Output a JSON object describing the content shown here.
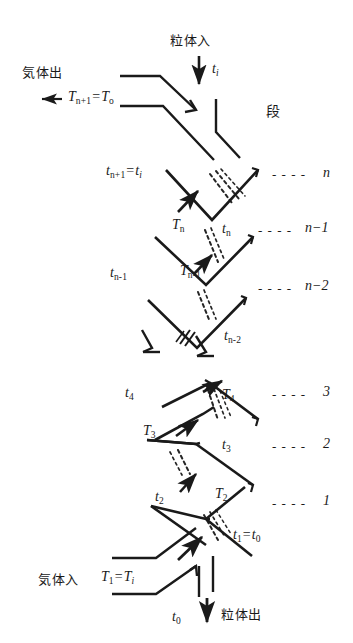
{
  "figure": {
    "domain_type": "process-flow-diagram",
    "ink_color": "#1a1a1a",
    "background_color": "#ffffff"
  },
  "header": {
    "stage_column_header": "段"
  },
  "inlets_outlets": {
    "particle_inlet_label": "粒体入",
    "particle_inlet_temp": "t",
    "particle_inlet_temp_sub": "i",
    "gas_outlet_label": "気体出",
    "gas_outlet_arrow": "←",
    "gas_inlet_label": "気体入",
    "particle_outlet_label": "粒体出",
    "particle_outlet_temp": "t",
    "particle_outlet_temp_sub": "0",
    "down_arrow": "↓"
  },
  "equations": {
    "gas_outlet_temp": {
      "lhs_base": "T",
      "lhs_sub": "n+1",
      "rhs_base": "T",
      "rhs_sub": "o"
    },
    "particle_top_temp": {
      "lhs_base": "t",
      "lhs_sub": "n+1",
      "rhs_base": "t",
      "rhs_sub": "i"
    },
    "gas_inlet_temp": {
      "lhs_base": "T",
      "lhs_sub": "1",
      "rhs_base": "T",
      "rhs_sub": "i"
    },
    "particle_bottom_temp": {
      "lhs_base": "t",
      "lhs_sub": "1",
      "rhs_base": "t",
      "rhs_sub": "0"
    }
  },
  "stages": [
    {
      "id": "stage-n",
      "number_text": "n",
      "dash_lead": "- - - -",
      "gas_temp_base": "T",
      "gas_temp_sub": "n",
      "solid_temp_base": "t",
      "solid_temp_sub": "n"
    },
    {
      "id": "stage-n-1",
      "number_text": "n−1",
      "dash_lead": "- - - -",
      "gas_temp_base": "T",
      "gas_temp_sub": "n-1",
      "solid_temp_base": "t",
      "solid_temp_sub": "n-1"
    },
    {
      "id": "stage-n-2",
      "number_text": "n−2",
      "dash_lead": "- - - -",
      "gas_temp_base": "T",
      "gas_temp_sub": "n-2",
      "solid_temp_base": "t",
      "solid_temp_sub": "n-2"
    },
    {
      "id": "stage-3",
      "number_text": "3",
      "dash_lead": "- - - -",
      "gas_temp_base": "T",
      "gas_temp_sub": "4",
      "solid_temp_base": "t",
      "solid_temp_sub": "4"
    },
    {
      "id": "stage-2",
      "number_text": "2",
      "dash_lead": "- - - -",
      "gas_temp_base": "T",
      "gas_temp_sub": "3",
      "solid_temp_base": "t",
      "solid_temp_sub": "3"
    },
    {
      "id": "stage-1",
      "number_text": "1",
      "dash_lead": "- - - -",
      "gas_temp_base": "T",
      "gas_temp_sub": "2",
      "solid_temp_base": "t",
      "solid_temp_sub": "2"
    }
  ],
  "labels": {
    "t_n_plus_1": "t",
    "T_n": "T",
    "t_n": "t",
    "T_n_minus_1": "T",
    "t_n_minus_1": "t",
    "t_n_minus_2": "t",
    "T_4": "T",
    "t_4": "t",
    "T_3": "T",
    "t_3": "t",
    "T_2": "T",
    "t_2": "t"
  },
  "notes": {
    "break_marker": "図中央の破断記号（装置中間段の省略）",
    "flow_description": "粒体は上から下へ、気体は下から上へ向流接触する"
  }
}
